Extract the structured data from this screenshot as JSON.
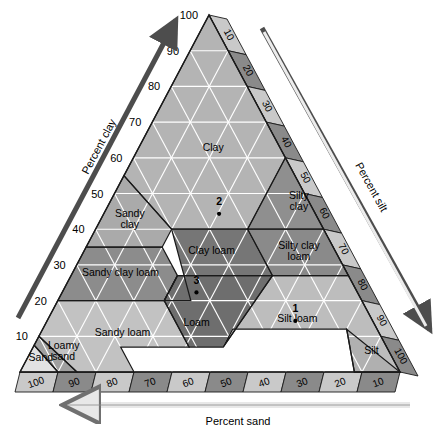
{
  "figure": {
    "axes": {
      "left": {
        "title": "Percent clay",
        "ticks": [
          "10",
          "20",
          "30",
          "40",
          "50",
          "60",
          "70",
          "80",
          "90",
          "100"
        ]
      },
      "right": {
        "title": "Percent silt",
        "ticks": [
          "10",
          "20",
          "30",
          "40",
          "50",
          "60",
          "70",
          "80",
          "90",
          "100"
        ]
      },
      "bottom": {
        "title": "Percent sand",
        "ticks": [
          "100",
          "90",
          "80",
          "70",
          "60",
          "50",
          "40",
          "30",
          "20",
          "10"
        ]
      }
    },
    "colors": {
      "clay": "#b4b4b4",
      "silty_clay": "#8f8f8f",
      "sandy_clay": "#aaaaaa",
      "clay_loam": "#767676",
      "silty_clay_loam": "#8a8a8a",
      "sandy_clay_loam": "#8c8c8c",
      "loam": "#6e6e6e",
      "silt_loam": "#bdbdbd",
      "silt": "#b0b0b0",
      "sandy_loam": "#c2c2c2",
      "loamy_sand": "#a0a0a0",
      "sand": "#e2e2e2",
      "band_light": "#c9c9c9",
      "band_dark": "#8a8a8a",
      "outline": "#1a1a1a",
      "hatch": "#ffffff",
      "arrow_dark": "#4d4d4d",
      "arrow_light": "#d8d8d8"
    }
  },
  "chart_data": {
    "type": "ternary",
    "axis_labels": {
      "a": "Percent clay",
      "b": "Percent silt",
      "c": "Percent sand"
    },
    "axis_range": [
      0,
      100
    ],
    "tick_step": 10,
    "grid": true,
    "classes": [
      {
        "name": "Clay",
        "label": "Clay",
        "fill": "#b4b4b4",
        "label_pos": {
          "clay": 62,
          "silt": 20,
          "sand": 18
        },
        "vertices": [
          {
            "clay": 100,
            "silt": 0,
            "sand": 0
          },
          {
            "clay": 60,
            "silt": 40,
            "sand": 0
          },
          {
            "clay": 40,
            "silt": 40,
            "sand": 20
          },
          {
            "clay": 40,
            "silt": 20,
            "sand": 40
          },
          {
            "clay": 55,
            "silt": 0,
            "sand": 45
          }
        ]
      },
      {
        "name": "Silty clay",
        "label": "Silty clay",
        "fill": "#8f8f8f",
        "label_pos": {
          "clay": 47,
          "silt": 50,
          "sand": 3
        },
        "vertices": [
          {
            "clay": 60,
            "silt": 40,
            "sand": 0
          },
          {
            "clay": 40,
            "silt": 60,
            "sand": 0
          },
          {
            "clay": 40,
            "silt": 40,
            "sand": 20
          }
        ]
      },
      {
        "name": "Sandy clay",
        "label": "Sandy clay",
        "fill": "#aaaaaa",
        "label_pos": {
          "clay": 42,
          "silt": 8,
          "sand": 50
        },
        "vertices": [
          {
            "clay": 55,
            "silt": 0,
            "sand": 45
          },
          {
            "clay": 40,
            "silt": 20,
            "sand": 40
          },
          {
            "clay": 35,
            "silt": 20,
            "sand": 45
          },
          {
            "clay": 35,
            "silt": 0,
            "sand": 65
          }
        ]
      },
      {
        "name": "Clay loam",
        "label": "Clay loam",
        "fill": "#767676",
        "label_pos": {
          "clay": 33,
          "silt": 34,
          "sand": 33
        },
        "vertices": [
          {
            "clay": 40,
            "silt": 20,
            "sand": 40
          },
          {
            "clay": 40,
            "silt": 40,
            "sand": 20
          },
          {
            "clay": 27,
            "silt": 53,
            "sand": 20
          },
          {
            "clay": 27,
            "silt": 28,
            "sand": 45
          },
          {
            "clay": 20,
            "silt": 28,
            "sand": 52
          },
          {
            "clay": 20,
            "silt": 35,
            "sand": 45
          }
        ]
      },
      {
        "name": "Silty clay loam",
        "label": "Silty clay loam",
        "fill": "#8a8a8a",
        "label_pos": {
          "clay": 33,
          "silt": 57,
          "sand": 10
        },
        "vertices": [
          {
            "clay": 40,
            "silt": 60,
            "sand": 0
          },
          {
            "clay": 27,
            "silt": 73,
            "sand": 0
          },
          {
            "clay": 27,
            "silt": 53,
            "sand": 20
          },
          {
            "clay": 40,
            "silt": 40,
            "sand": 20
          }
        ]
      },
      {
        "name": "Sandy clay loam",
        "label": "Sandy clay loam",
        "fill": "#8c8c8c",
        "label_pos": {
          "clay": 27,
          "silt": 13,
          "sand": 60
        },
        "vertices": [
          {
            "clay": 35,
            "silt": 0,
            "sand": 65
          },
          {
            "clay": 35,
            "silt": 20,
            "sand": 45
          },
          {
            "clay": 27,
            "silt": 28,
            "sand": 45
          },
          {
            "clay": 20,
            "silt": 28,
            "sand": 52
          },
          {
            "clay": 20,
            "silt": 0,
            "sand": 80
          }
        ]
      },
      {
        "name": "Loam",
        "label": "Loam",
        "fill": "#6e6e6e",
        "label_pos": {
          "clay": 13,
          "silt": 40,
          "sand": 47
        },
        "vertices": [
          {
            "clay": 27,
            "silt": 28,
            "sand": 45
          },
          {
            "clay": 27,
            "silt": 53,
            "sand": 20
          },
          {
            "clay": 7,
            "silt": 50,
            "sand": 43
          },
          {
            "clay": 7,
            "silt": 41,
            "sand": 52
          },
          {
            "clay": 20,
            "silt": 28,
            "sand": 52
          }
        ]
      },
      {
        "name": "Silt loam",
        "label": "Silt loam",
        "fill": "#bdbdbd",
        "label_pos": {
          "clay": 14,
          "silt": 66,
          "sand": 20
        },
        "vertices": [
          {
            "clay": 27,
            "silt": 73,
            "sand": 0
          },
          {
            "clay": 0,
            "silt": 100,
            "sand": 0
          },
          {
            "clay": 0,
            "silt": 88,
            "sand": 12
          },
          {
            "clay": 12,
            "silt": 80,
            "sand": 8
          },
          {
            "clay": 12,
            "silt": 50,
            "sand": 38
          },
          {
            "clay": 7,
            "silt": 50,
            "sand": 43
          },
          {
            "clay": 27,
            "silt": 53,
            "sand": 20
          }
        ]
      },
      {
        "name": "Silt",
        "label": "Silt",
        "fill": "#b0b0b0",
        "label_pos": {
          "clay": 5,
          "silt": 90,
          "sand": 5
        },
        "vertices": [
          {
            "clay": 0,
            "silt": 100,
            "sand": 0
          },
          {
            "clay": 0,
            "silt": 88,
            "sand": 12
          },
          {
            "clay": 12,
            "silt": 80,
            "sand": 8
          }
        ]
      },
      {
        "name": "Sandy loam",
        "label": "Sandy loam",
        "fill": "#c2c2c2",
        "label_pos": {
          "clay": 10,
          "silt": 22,
          "sand": 68
        },
        "vertices": [
          {
            "clay": 20,
            "silt": 0,
            "sand": 80
          },
          {
            "clay": 20,
            "silt": 28,
            "sand": 52
          },
          {
            "clay": 7,
            "silt": 41,
            "sand": 52
          },
          {
            "clay": 7,
            "silt": 23,
            "sand": 70
          },
          {
            "clay": 0,
            "silt": 30,
            "sand": 70
          },
          {
            "clay": 0,
            "silt": 15,
            "sand": 85
          },
          {
            "clay": 10,
            "silt": 0,
            "sand": 90
          }
        ]
      },
      {
        "name": "Loamy sand",
        "label": "Loamy sand",
        "fill": "#a0a0a0",
        "label_pos": {
          "clay": 5,
          "silt": 9,
          "sand": 86
        },
        "vertices": [
          {
            "clay": 10,
            "silt": 0,
            "sand": 90
          },
          {
            "clay": 0,
            "silt": 15,
            "sand": 85
          },
          {
            "clay": 0,
            "silt": 10,
            "sand": 90
          },
          {
            "clay": 7.5,
            "silt": 0,
            "sand": 92.5
          }
        ]
      },
      {
        "name": "Sand",
        "label": "Sand",
        "fill": "#e2e2e2",
        "label_pos": {
          "clay": 3,
          "silt": 4,
          "sand": 93
        },
        "vertices": [
          {
            "clay": 7.5,
            "silt": 0,
            "sand": 92.5
          },
          {
            "clay": 0,
            "silt": 10,
            "sand": 90
          },
          {
            "clay": 0,
            "silt": 0,
            "sand": 100
          }
        ]
      }
    ],
    "points": [
      {
        "label": "1",
        "clay": 15,
        "silt": 65,
        "sand": 20,
        "class": "Silt loam"
      },
      {
        "label": "2",
        "clay": 45,
        "silt": 30,
        "sand": 25,
        "class": "Clay"
      },
      {
        "label": "3",
        "clay": 23,
        "silt": 35,
        "sand": 42,
        "class": "Clay loam"
      }
    ]
  }
}
